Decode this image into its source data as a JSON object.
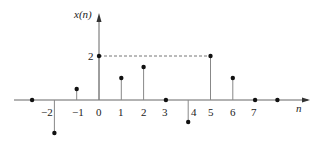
{
  "chart_data": {
    "type": "stem",
    "title": "",
    "xlabel": "n",
    "ylabel": "x(n)",
    "x": [
      -3,
      -2,
      -1,
      0,
      1,
      2,
      3,
      4,
      5,
      6,
      7,
      8
    ],
    "values": [
      0,
      -1.5,
      0.5,
      2,
      1,
      1.5,
      0,
      -1,
      2,
      1,
      0,
      0
    ],
    "x_tick_labels": [
      "-2",
      "-1",
      "0",
      "1",
      "2",
      "3",
      "4",
      "5",
      "6",
      "7"
    ],
    "y_tick_labels": [
      "2"
    ],
    "annotations": [
      {
        "type": "dashed-line",
        "from": [
          0,
          2
        ],
        "to": [
          5,
          2
        ]
      }
    ],
    "grid": false,
    "legend": null
  },
  "labels": {
    "ylabel": "x(n)",
    "xlabel": "n",
    "y_tick": "2",
    "x_ticks": [
      "−2",
      "−1",
      "0",
      "1",
      "2",
      "3",
      "4",
      "5",
      "6",
      "7"
    ]
  },
  "colors": {
    "axis": "#555555",
    "stem": "#888888",
    "marker": "#111111"
  }
}
